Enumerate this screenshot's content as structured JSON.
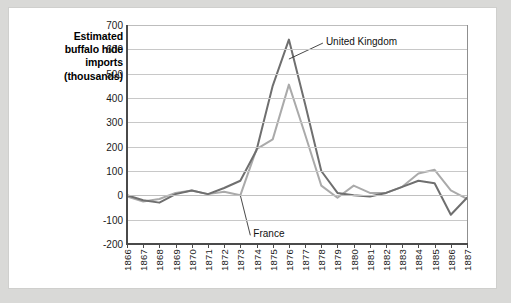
{
  "chart_data": {
    "type": "line",
    "title": "Estimated buffalo hide imports (thousands)",
    "title_lines": [
      "Estimated",
      "buffalo hide",
      "imports",
      "(thousands)"
    ],
    "xlabel": "",
    "ylabel": "Estimated buffalo hide imports (thousands)",
    "x": [
      1866,
      1867,
      1868,
      1869,
      1870,
      1871,
      1872,
      1873,
      1874,
      1875,
      1876,
      1877,
      1878,
      1879,
      1880,
      1881,
      1882,
      1883,
      1884,
      1885,
      1886,
      1887
    ],
    "categories": [
      "1866",
      "1867",
      "1868",
      "1869",
      "1870",
      "1871",
      "1872",
      "1873",
      "1874",
      "1875",
      "1876",
      "1877",
      "1878",
      "1879",
      "1880",
      "1881",
      "1882",
      "1883",
      "1884",
      "1885",
      "1886",
      "1887"
    ],
    "xlim": [
      1866,
      1887
    ],
    "ylim": [
      -200,
      700
    ],
    "yticks": [
      -200,
      -100,
      0,
      100,
      200,
      300,
      400,
      500,
      600,
      700
    ],
    "grid": true,
    "legend": "annotations",
    "series": [
      {
        "name": "United Kingdom",
        "color": "#6f6f6f",
        "values": [
          0,
          -20,
          -30,
          5,
          20,
          5,
          30,
          60,
          185,
          450,
          640,
          375,
          100,
          10,
          0,
          -5,
          10,
          35,
          60,
          50,
          -80,
          -10
        ]
      },
      {
        "name": "France",
        "color": "#aaaaaa",
        "values": [
          -5,
          -25,
          -15,
          10,
          20,
          5,
          15,
          0,
          190,
          230,
          455,
          250,
          40,
          -10,
          40,
          10,
          10,
          35,
          90,
          105,
          20,
          -15
        ]
      }
    ],
    "annotations": [
      {
        "text": "United Kingdom",
        "target_year": 1876,
        "target_value": 560
      },
      {
        "text": "France",
        "target_year": 1873,
        "target_value": 0
      }
    ]
  },
  "figure": {
    "background_color": "#ffffff",
    "page_background_color": "#d9d9d7",
    "axis_color": "#4a4a4a",
    "grid_color": "#c8c8c8"
  }
}
